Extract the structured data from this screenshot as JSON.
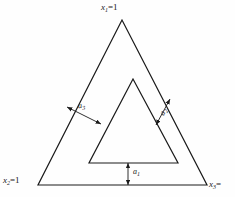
{
  "figure": {
    "type": "ternary-simplex-constraint-diagram",
    "background_color": "#fefefe",
    "line_color": "#1a1a1a"
  },
  "vertices": {
    "top": {
      "label_text": "x",
      "label_sub": "1",
      "label_eq": "=1",
      "full": "x1=1"
    },
    "bottom_left": {
      "label_text": "x",
      "label_sub": "2",
      "label_eq": "=1",
      "full": "x2=1"
    },
    "bottom_right": {
      "label_text": "x",
      "label_sub": "3",
      "label_eq": "=",
      "full": "x3="
    }
  },
  "dimensions": [
    {
      "name": "bottom-offset",
      "label_text": "a",
      "label_sub": "1",
      "full": "a1"
    },
    {
      "name": "right-offset",
      "label_text": "a",
      "label_sub": "2",
      "full": "a2"
    },
    {
      "name": "left-offset",
      "label_text": "a",
      "label_sub": "3",
      "full": "a3"
    }
  ],
  "geometry": {
    "outer_triangle": "122,20 38,185 207,185",
    "inner_triangle": "133,79 89,163 178,163",
    "arrow_a3": "67,107 101,124",
    "arrow_a2": "170,99 156,125",
    "arrow_a1": "128,163 128,185"
  }
}
